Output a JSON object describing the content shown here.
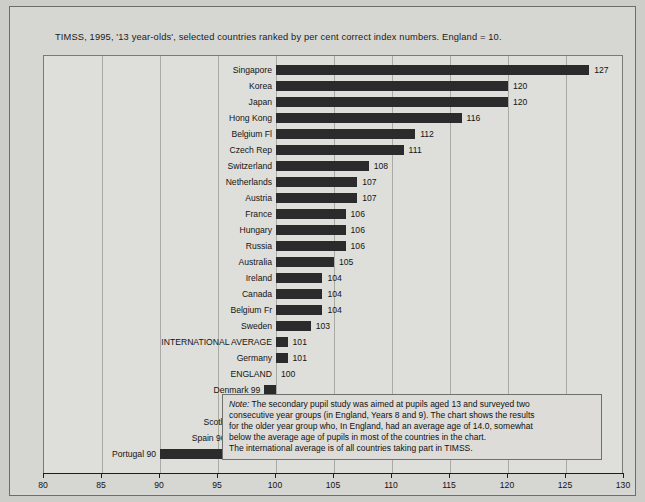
{
  "title": "TIMSS, 1995, '13 year-olds', selected countries ranked by per cent correct index numbers.  England = 10.",
  "note": {
    "lead": "Note:",
    "lines": [
      " The secondary pupil study was aimed at pupils aged 13 and surveyed two",
      "consecutive year groups (in England, Years 8 and 9). The chart shows the results",
      "for the older year group who, In England, had an average age of 14.0, somewhat",
      "below the average age of pupils in most of the countries in the chart.",
      "The international average is of all countries taking part in TIMSS."
    ]
  },
  "colors": {
    "bar": "#2b2b2b",
    "plot_background": "#dededa",
    "page_background": "#cdcdc9",
    "gridline": "#a9a9a5",
    "axis": "#1d1d1d"
  },
  "chart_data": {
    "type": "bar",
    "orientation": "horizontal",
    "title": "TIMSS, 1995, '13 year-olds', selected countries ranked by per cent correct index numbers.  England = 10.",
    "xlabel": "",
    "ylabel": "",
    "xlim": [
      80,
      130
    ],
    "baseline": 100,
    "grid": true,
    "legend": "none",
    "xticks": [
      80,
      85,
      90,
      95,
      100,
      105,
      110,
      115,
      120,
      125,
      130
    ],
    "xticklabels": [
      "80",
      "85",
      "90",
      "95",
      "100",
      "105",
      "110",
      "115",
      "120",
      "125",
      "130"
    ],
    "categories": [
      "Singapore",
      "Korea",
      "Japan",
      "Hong Kong",
      "Belgium Fl",
      "Czech Rep",
      "Switzerland",
      "Netherlands",
      "Austria",
      "France",
      "Hungary",
      "Russia",
      "Australia",
      "Ireland",
      "Canada",
      "Belgium Fr",
      "Sweden",
      "INTERNATIONAL AVERAGE",
      "Germany",
      "ENGLAND",
      "Denmark",
      "USA",
      "Scotland",
      "Spain",
      "Portugal"
    ],
    "values": [
      127,
      120,
      120,
      116,
      112,
      111,
      108,
      107,
      107,
      106,
      106,
      106,
      105,
      104,
      104,
      104,
      103,
      101,
      101,
      100,
      99,
      99,
      98,
      96,
      90
    ],
    "rows": [
      {
        "label": "Singapore",
        "value": 127,
        "value_text": "127",
        "label_text": "Singapore",
        "below": false
      },
      {
        "label": "Korea",
        "value": 120,
        "value_text": "120",
        "label_text": "Korea",
        "below": false
      },
      {
        "label": "Japan",
        "value": 120,
        "value_text": "120",
        "label_text": "Japan",
        "below": false
      },
      {
        "label": "Hong Kong",
        "value": 116,
        "value_text": "116",
        "label_text": "Hong Kong",
        "below": false
      },
      {
        "label": "Belgium Fl",
        "value": 112,
        "value_text": "112",
        "label_text": "Belgium Fl",
        "below": false
      },
      {
        "label": "Czech Rep",
        "value": 111,
        "value_text": "111",
        "label_text": "Czech Rep",
        "below": false
      },
      {
        "label": "Switzerland",
        "value": 108,
        "value_text": "108",
        "label_text": "Switzerland",
        "below": false
      },
      {
        "label": "Netherlands",
        "value": 107,
        "value_text": "107",
        "label_text": "Netherlands",
        "below": false
      },
      {
        "label": "Austria",
        "value": 107,
        "value_text": "107",
        "label_text": "Austria",
        "below": false
      },
      {
        "label": "France",
        "value": 106,
        "value_text": "106",
        "label_text": "France",
        "below": false
      },
      {
        "label": "Hungary",
        "value": 106,
        "value_text": "106",
        "label_text": "Hungary",
        "below": false
      },
      {
        "label": "Russia",
        "value": 106,
        "value_text": "106",
        "label_text": "Russia",
        "below": false
      },
      {
        "label": "Australia",
        "value": 105,
        "value_text": "105",
        "label_text": "Australia",
        "below": false
      },
      {
        "label": "Ireland",
        "value": 104,
        "value_text": "104",
        "label_text": "Ireland",
        "below": false
      },
      {
        "label": "Canada",
        "value": 104,
        "value_text": "104",
        "label_text": "Canada",
        "below": false
      },
      {
        "label": "Belgium Fr",
        "value": 104,
        "value_text": "104",
        "label_text": "Belgium Fr",
        "below": false
      },
      {
        "label": "Sweden",
        "value": 103,
        "value_text": "103",
        "label_text": "Sweden",
        "below": false
      },
      {
        "label": "INTERNATIONAL AVERAGE",
        "value": 101,
        "value_text": "101",
        "label_text": "INTERNATIONAL AVERAGE",
        "below": false
      },
      {
        "label": "Germany",
        "value": 101,
        "value_text": "101",
        "label_text": "Germany",
        "below": false
      },
      {
        "label": "ENGLAND",
        "value": 100,
        "value_text": "100",
        "label_text": "ENGLAND",
        "below": false
      },
      {
        "label": "Denmark",
        "value": 99,
        "value_text": "",
        "label_text": "Denmark 99",
        "below": true
      },
      {
        "label": "USA",
        "value": 99,
        "value_text": "",
        "label_text": "USA 99",
        "below": true
      },
      {
        "label": "Scotland",
        "value": 98,
        "value_text": "",
        "label_text": "Scotland 98",
        "below": true
      },
      {
        "label": "Spain",
        "value": 96,
        "value_text": "",
        "label_text": "Spain 96",
        "below": true
      },
      {
        "label": "Portugal",
        "value": 90,
        "value_text": "",
        "label_text": "Portugal 90",
        "below": true
      }
    ]
  }
}
